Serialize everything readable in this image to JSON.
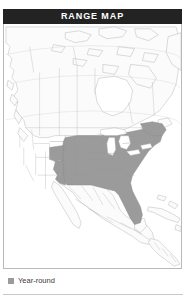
{
  "card": {
    "header": {
      "title": "RANGE MAP",
      "background_color": "#232323",
      "text_color": "#ffffff"
    },
    "map": {
      "name": "north-america-range-map",
      "region": "North America",
      "ocean_color": "#ffffff",
      "land_color": "#fbfbfb",
      "border_color": "#b0b0b0",
      "range_fill_color": "#9b9b9b",
      "frame_color": "#b9b9b9",
      "described_areas": [
        "Canada",
        "United States",
        "Mexico",
        "Central America",
        "Cuba",
        "Bahamas",
        "Greenland edge",
        "Hudson Bay",
        "Great Lakes",
        "Baja California",
        "Gulf of Mexico",
        "Florida"
      ],
      "range_description": "Shaded year-round range covering the eastern and central United States from the Great Plains east to the Atlantic coast, north to the Great Lakes and southern New England, and south through Florida and the Gulf coast."
    },
    "legend": {
      "items": [
        {
          "label": "Year-round",
          "swatch_color": "#9b9b9b",
          "swatch_shape": "square"
        }
      ]
    }
  }
}
